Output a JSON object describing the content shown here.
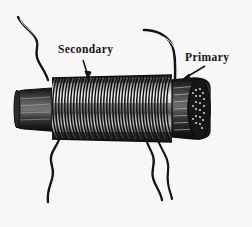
{
  "figure": {
    "style": "vintage line engraving",
    "background_color": "#f8f6f6",
    "ink_color": "#141414"
  },
  "labels": {
    "secondary": "Secondary",
    "primary": "Primary"
  },
  "annotations": [
    {
      "name": "secondary-leader-arrow",
      "label": "Secondary",
      "points_to": "coil-winding",
      "arrow_from": [
        83,
        62
      ],
      "arrow_to": [
        88,
        78
      ]
    },
    {
      "name": "primary-leader-arrow",
      "label": "Primary",
      "points_to": "primary-lead-wire",
      "arrow_from": [
        204,
        67
      ],
      "arrow_to": [
        182,
        80
      ]
    }
  ],
  "parts": {
    "coil_winding": {
      "name": "secondary-winding",
      "turns": 44,
      "left": 52,
      "right": 172,
      "top": 78,
      "bottom": 139
    },
    "core_left": {
      "name": "core-left-stub",
      "left": 16,
      "right": 52,
      "color": "#1b1b1b"
    },
    "core_right": {
      "name": "core-right-end",
      "left": 172,
      "right": 212,
      "color": "#1b1b1b",
      "detail": "bundled iron wire core end cap"
    },
    "leads": [
      {
        "name": "lead-top-left",
        "terminal": "secondary"
      },
      {
        "name": "lead-bottom-left",
        "terminal": "secondary"
      },
      {
        "name": "lead-bottom-mid",
        "terminal": "secondary"
      },
      {
        "name": "lead-bottom-right",
        "terminal": "primary"
      },
      {
        "name": "lead-top-right",
        "terminal": "primary"
      }
    ]
  }
}
